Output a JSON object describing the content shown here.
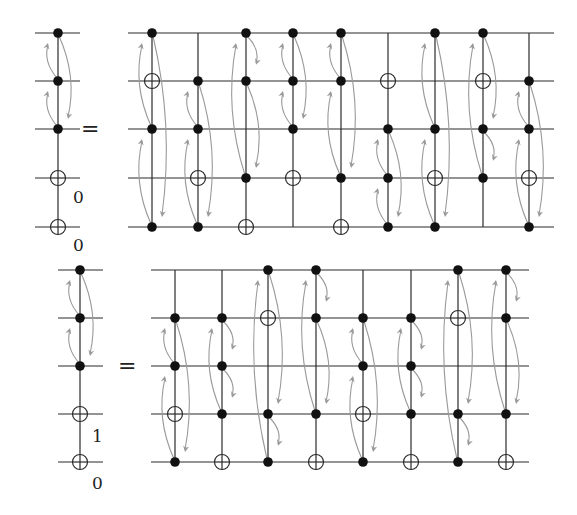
{
  "figure": {
    "width": 577,
    "height": 515,
    "colors": {
      "wire": "#2a2a2a",
      "dot": "#111111",
      "arrow": "#9a9a9a"
    }
  },
  "circuits": [
    {
      "name": "top",
      "rows": [
        33,
        81,
        129,
        178,
        227
      ],
      "lhs": {
        "x": 58,
        "wire_x": [
          35,
          80
        ],
        "dots": [
          0,
          1,
          2
        ],
        "targets": [
          3,
          4
        ],
        "line": [
          0,
          4
        ],
        "arrows": [
          [
            1,
            0,
            "L"
          ],
          [
            2,
            1,
            "L"
          ],
          [
            0,
            2,
            "R"
          ]
        ],
        "labels": [
          {
            "text": "0",
            "x": 73,
            "y": 203
          },
          {
            "text": "0",
            "x": 73,
            "y": 251
          }
        ]
      },
      "equals": {
        "text": "=",
        "x": 81,
        "y": 136
      },
      "rhs": {
        "wire_x": [
          128,
          554
        ],
        "gates": [
          {
            "x": 152,
            "dots": [
              0,
              2,
              4
            ],
            "targets": [
              1
            ],
            "line": [
              0,
              4
            ],
            "arrows": [
              [
                2,
                0,
                "L"
              ],
              [
                4,
                2,
                "L"
              ],
              [
                0,
                4,
                "R"
              ]
            ]
          },
          {
            "x": 198,
            "dots": [
              1,
              2,
              4
            ],
            "targets": [
              3
            ],
            "line": [
              0,
              4
            ],
            "arrows": [
              [
                2,
                1,
                "L"
              ],
              [
                4,
                2,
                "L"
              ],
              [
                1,
                4,
                "R"
              ]
            ]
          },
          {
            "x": 246,
            "dots": [
              0,
              1,
              3
            ],
            "targets": [
              4
            ],
            "line": [
              0,
              4
            ],
            "arrows": [
              [
                3,
                0,
                "L"
              ],
              [
                0,
                "s",
                "R"
              ],
              [
                1,
                3,
                "R"
              ]
            ]
          },
          {
            "x": 293,
            "dots": [
              0,
              1,
              2
            ],
            "targets": [
              3
            ],
            "line": [
              0,
              4
            ],
            "arrows": [
              [
                1,
                0,
                "L"
              ],
              [
                2,
                1,
                "L"
              ],
              [
                0,
                2,
                "R"
              ]
            ]
          },
          {
            "x": 341,
            "dots": [
              0,
              1,
              3
            ],
            "targets": [
              4
            ],
            "line": [
              0,
              4
            ],
            "arrows": [
              [
                1,
                0,
                "L"
              ],
              [
                3,
                1,
                "L"
              ],
              [
                0,
                3,
                "R"
              ]
            ]
          },
          {
            "x": 388,
            "dots": [
              2,
              3,
              4
            ],
            "targets": [
              1
            ],
            "line": [
              0,
              4
            ],
            "arrows": [
              [
                3,
                2,
                "L"
              ],
              [
                4,
                3,
                "L"
              ],
              [
                2,
                4,
                "R"
              ]
            ]
          },
          {
            "x": 435,
            "dots": [
              0,
              2,
              4
            ],
            "targets": [
              3
            ],
            "line": [
              0,
              4
            ],
            "arrows": [
              [
                2,
                0,
                "L"
              ],
              [
                4,
                2,
                "L"
              ],
              [
                0,
                4,
                "R"
              ]
            ]
          },
          {
            "x": 483,
            "dots": [
              0,
              2,
              3
            ],
            "targets": [
              1
            ],
            "line": [
              0,
              4
            ],
            "arrows": [
              [
                3,
                0,
                "L"
              ],
              [
                0,
                2,
                "R"
              ],
              [
                2,
                "s",
                "R"
              ]
            ]
          },
          {
            "x": 529,
            "dots": [
              1,
              2,
              4
            ],
            "targets": [
              3
            ],
            "line": [
              0,
              4
            ],
            "arrows": [
              [
                2,
                1,
                "L"
              ],
              [
                4,
                2,
                "L"
              ],
              [
                1,
                4,
                "R"
              ]
            ]
          }
        ]
      }
    },
    {
      "name": "bottom",
      "rows": [
        270,
        318,
        366,
        414,
        462
      ],
      "lhs": {
        "x": 80,
        "wire_x": [
          58,
          103
        ],
        "dots": [
          0,
          1,
          2
        ],
        "targets": [
          3,
          4
        ],
        "line": [
          0,
          4
        ],
        "arrows": [
          [
            1,
            0,
            "L"
          ],
          [
            2,
            1,
            "L"
          ],
          [
            0,
            2,
            "R"
          ]
        ],
        "labels": [
          {
            "text": "1",
            "x": 92,
            "y": 442
          },
          {
            "text": "0",
            "x": 92,
            "y": 489
          }
        ]
      },
      "equals": {
        "text": "=",
        "x": 118,
        "y": 373
      },
      "rhs": {
        "wire_x": [
          151,
          529
        ],
        "gates": [
          {
            "x": 175,
            "dots": [
              1,
              2,
              4
            ],
            "targets": [
              3
            ],
            "line": [
              0,
              4
            ],
            "arrows": [
              [
                2,
                1,
                "L"
              ],
              [
                4,
                2,
                "L"
              ],
              [
                1,
                4,
                "R"
              ]
            ]
          },
          {
            "x": 222,
            "dots": [
              1,
              2,
              3
            ],
            "targets": [
              4
            ],
            "line": [
              0,
              4
            ],
            "arrows": [
              [
                3,
                1,
                "L"
              ],
              [
                1,
                "s",
                "R"
              ],
              [
                2,
                "s",
                "R"
              ]
            ]
          },
          {
            "x": 268,
            "dots": [
              0,
              3,
              4
            ],
            "targets": [
              1
            ],
            "line": [
              0,
              4
            ],
            "arrows": [
              [
                4,
                0,
                "L"
              ],
              [
                0,
                3,
                "R"
              ],
              [
                3,
                "s",
                "R"
              ]
            ]
          },
          {
            "x": 316,
            "dots": [
              0,
              1,
              3
            ],
            "targets": [
              4
            ],
            "line": [
              0,
              4
            ],
            "arrows": [
              [
                3,
                0,
                "L"
              ],
              [
                0,
                "s",
                "R"
              ],
              [
                1,
                3,
                "R"
              ]
            ]
          },
          {
            "x": 363,
            "dots": [
              1,
              2,
              4
            ],
            "targets": [
              3
            ],
            "line": [
              0,
              4
            ],
            "arrows": [
              [
                2,
                1,
                "L"
              ],
              [
                4,
                2,
                "L"
              ],
              [
                1,
                4,
                "R"
              ]
            ]
          },
          {
            "x": 411,
            "dots": [
              1,
              2,
              3
            ],
            "targets": [
              4
            ],
            "line": [
              0,
              4
            ],
            "arrows": [
              [
                3,
                1,
                "L"
              ],
              [
                1,
                "s",
                "R"
              ],
              [
                2,
                "s",
                "R"
              ]
            ]
          },
          {
            "x": 458,
            "dots": [
              0,
              3,
              4
            ],
            "targets": [
              1
            ],
            "line": [
              0,
              4
            ],
            "arrows": [
              [
                4,
                0,
                "L"
              ],
              [
                0,
                3,
                "R"
              ],
              [
                3,
                "s",
                "R"
              ]
            ]
          },
          {
            "x": 506,
            "dots": [
              0,
              1,
              3
            ],
            "targets": [
              4
            ],
            "line": [
              0,
              4
            ],
            "arrows": [
              [
                3,
                0,
                "L"
              ],
              [
                0,
                "s",
                "R"
              ],
              [
                1,
                3,
                "R"
              ]
            ]
          }
        ]
      }
    }
  ]
}
